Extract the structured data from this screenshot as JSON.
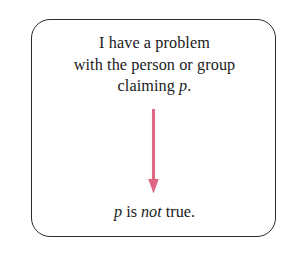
{
  "figure": {
    "name": "argument-box",
    "background_color": "#ffffff",
    "box": {
      "border_color": "#2a2a2c",
      "fill_color": "#ffffff",
      "corner_radius": "19px"
    },
    "premise": {
      "lines": [
        "I have a problem",
        "with the person or group",
        "claiming p."
      ],
      "line3_text_before": "claiming ",
      "line3_variable": "p",
      "line3_text_after": "."
    },
    "arrow": {
      "color": "#df6685",
      "direction": "down",
      "icon": "down-arrow-icon"
    },
    "conclusion": {
      "variable": "p",
      "text_middle": " is ",
      "emphasis": "not",
      "text_end": " true."
    }
  }
}
